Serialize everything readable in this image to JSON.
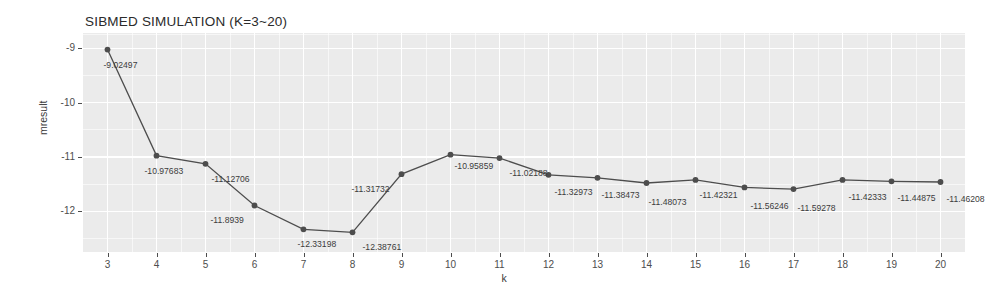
{
  "chart_data": {
    "type": "line",
    "title": "SIBMED SIMULATION (K=3~20)",
    "xlabel": "k",
    "ylabel": "mresult",
    "x": [
      3,
      4,
      5,
      6,
      7,
      8,
      9,
      10,
      11,
      12,
      13,
      14,
      15,
      16,
      17,
      18,
      19,
      20
    ],
    "values": [
      -9.02497,
      -10.97683,
      -11.12706,
      -11.8939,
      -12.33198,
      -12.38761,
      -11.31732,
      -10.95859,
      -11.02188,
      -11.32973,
      -11.38473,
      -11.48073,
      -11.42321,
      -11.56246,
      -11.59278,
      -11.42333,
      -11.44875,
      -11.46208
    ],
    "point_labels": [
      "-9.02497",
      "-10.97683",
      "-11.12706",
      "-11.8939",
      "-12.33198",
      "-12.38761",
      "-11.31732",
      "-10.95859",
      "-11.02188",
      "-11.32973",
      "-11.38473",
      "-11.48073",
      "-11.42321",
      "-11.56246",
      "-11.59278",
      "-11.42333",
      "-11.44875",
      "-11.46208"
    ],
    "xtick_labels": [
      "3",
      "4",
      "5",
      "6",
      "7",
      "8",
      "9",
      "10",
      "11",
      "12",
      "13",
      "14",
      "15",
      "16",
      "17",
      "18",
      "19",
      "20"
    ],
    "ytick_labels": [
      "-9",
      "-10",
      "-11",
      "-12"
    ],
    "ytick_values": [
      -9,
      -10,
      -11,
      -12
    ],
    "xlim": [
      2.5,
      20.5
    ],
    "ylim": [
      -12.75,
      -8.72
    ],
    "grid": true,
    "legend": "none",
    "series_color": "#4d4d4d",
    "panel_color": "#ebebeb",
    "grid_color": "#ffffff"
  }
}
